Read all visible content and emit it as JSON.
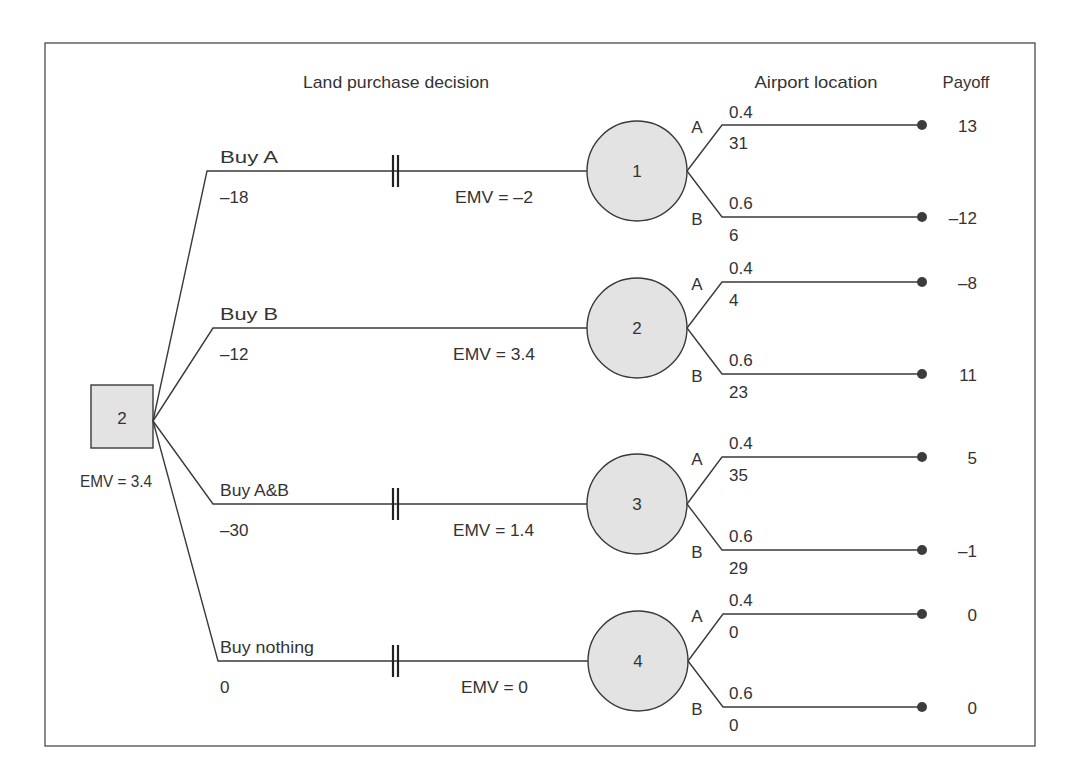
{
  "headers": {
    "decision": "Land purchase decision",
    "chance": "Airport location",
    "payoff": "Payoff"
  },
  "root": {
    "label": "2",
    "emv": "EMV = 3.4"
  },
  "branches": [
    {
      "name": "Buy A",
      "cost": "–18",
      "pruned": true,
      "emv": "EMV = –2",
      "node": "1",
      "outcomes": [
        {
          "label": "A",
          "prob": "0.4",
          "value": "31",
          "payoff": "13"
        },
        {
          "label": "B",
          "prob": "0.6",
          "value": "6",
          "payoff": "–12"
        }
      ]
    },
    {
      "name": "Buy B",
      "cost": "–12",
      "pruned": false,
      "emv": "EMV = 3.4",
      "node": "2",
      "outcomes": [
        {
          "label": "A",
          "prob": "0.4",
          "value": "4",
          "payoff": "–8"
        },
        {
          "label": "B",
          "prob": "0.6",
          "value": "23",
          "payoff": "11"
        }
      ]
    },
    {
      "name": "Buy A&B",
      "cost": "–30",
      "pruned": true,
      "emv": "EMV = 1.4",
      "node": "3",
      "outcomes": [
        {
          "label": "A",
          "prob": "0.4",
          "value": "35",
          "payoff": "5"
        },
        {
          "label": "B",
          "prob": "0.6",
          "value": "29",
          "payoff": "–1"
        }
      ]
    },
    {
      "name": "Buy nothing",
      "cost": "0",
      "pruned": true,
      "emv": "EMV = 0",
      "node": "4",
      "outcomes": [
        {
          "label": "A",
          "prob": "0.4",
          "value": "0",
          "payoff": "0"
        },
        {
          "label": "B",
          "prob": "0.6",
          "value": "0",
          "payoff": "0"
        }
      ]
    }
  ],
  "colors": {
    "node_fill": "#e3e3e3",
    "line": "#3a3a3a",
    "text": "#333333"
  }
}
